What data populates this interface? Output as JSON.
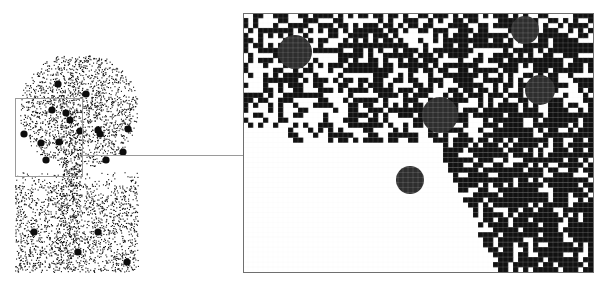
{
  "figure": {
    "width": 606,
    "height": 288,
    "background": "#ffffff",
    "source_image": {
      "label": "stippled tree illustration",
      "x": 15,
      "y": 55,
      "width": 123,
      "height": 217,
      "ink_color": "#111111",
      "fruit_color": "#0d0d0d",
      "fruits": [
        [
          24,
          134
        ],
        [
          41,
          143
        ],
        [
          59,
          142
        ],
        [
          80,
          131
        ],
        [
          100,
          134
        ],
        [
          128,
          129
        ],
        [
          123,
          152
        ],
        [
          46,
          160
        ],
        [
          106,
          160
        ],
        [
          86,
          94
        ],
        [
          58,
          84
        ],
        [
          52,
          110
        ],
        [
          70,
          120
        ],
        [
          98,
          130
        ],
        [
          34,
          232
        ],
        [
          78,
          252
        ],
        [
          98,
          232
        ],
        [
          127,
          262
        ],
        [
          66,
          113
        ]
      ]
    },
    "selection_box": {
      "label": "magnified region marker",
      "x": 15,
      "y": 98,
      "width": 67,
      "height": 78,
      "stroke": "#9a9a9a"
    },
    "connector_line": {
      "x1": 82,
      "y1": 155,
      "x2": 243,
      "y2": 155,
      "stroke": "#9a9a9a"
    },
    "magnified_view": {
      "label": "pixel-level magnified view",
      "x": 243,
      "y": 13,
      "width": 350,
      "height": 259,
      "cols": 70,
      "rows": 52,
      "border": "#6f6f6f",
      "pixel_color": "#111111",
      "grid_color": "#ececec",
      "fruit_color": "#2e2e2e",
      "fruits": [
        {
          "cx": 295,
          "cy": 52,
          "r": 17
        },
        {
          "cx": 525,
          "cy": 30,
          "r": 14
        },
        {
          "cx": 440,
          "cy": 115,
          "r": 18
        },
        {
          "cx": 410,
          "cy": 180,
          "r": 14
        },
        {
          "cx": 540,
          "cy": 90,
          "r": 15
        }
      ]
    }
  }
}
